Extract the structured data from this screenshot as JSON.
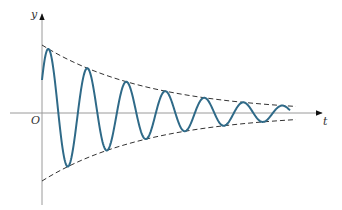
{
  "diagram": {
    "labels": {
      "y_axis": "y",
      "x_axis": "t",
      "origin": "O"
    },
    "colors": {
      "axis": "#9a9a9a",
      "curve": "#2f6a88",
      "envelope": "#333333",
      "text": "#333333",
      "background": "#ffffff"
    }
  },
  "chart_data": {
    "type": "line",
    "title": "",
    "xlabel": "t",
    "ylabel": "y",
    "series": [
      {
        "name": "damped oscillation",
        "style": "solid",
        "formula": "y = A e^{-kt} sin(ωt + φ)"
      },
      {
        "name": "upper envelope",
        "style": "dashed",
        "formula": "y = A e^{-kt}"
      },
      {
        "name": "lower envelope",
        "style": "dashed",
        "formula": "y = -A e^{-kt}"
      }
    ],
    "peaks_px": [
      [
        57,
        54
      ],
      [
        97,
        74
      ],
      [
        136,
        89
      ],
      [
        175,
        95
      ],
      [
        214,
        101
      ],
      [
        253,
        104
      ]
    ],
    "troughs_px": [
      [
        78,
        159
      ],
      [
        117,
        145
      ],
      [
        156,
        132
      ],
      [
        195,
        126
      ],
      [
        234,
        121
      ],
      [
        272,
        118
      ]
    ],
    "grid": false
  }
}
